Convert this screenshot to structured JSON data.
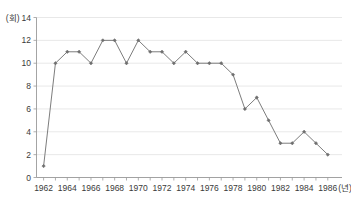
{
  "chart_data": {
    "type": "line",
    "title": "",
    "subtitle": "",
    "xlabel": "(년)",
    "ylabel": "(회)",
    "x": [
      1962,
      1963,
      1964,
      1965,
      1966,
      1967,
      1968,
      1969,
      1970,
      1971,
      1972,
      1973,
      1974,
      1975,
      1976,
      1977,
      1978,
      1979,
      1980,
      1981,
      1982,
      1983,
      1984,
      1985,
      1986
    ],
    "values": [
      1,
      10,
      11,
      11,
      10,
      12,
      12,
      10,
      12,
      11,
      11,
      10,
      11,
      10,
      10,
      10,
      9,
      6,
      7,
      5,
      3,
      3,
      4,
      3,
      2
    ],
    "series": [
      {
        "name": "",
        "values": [
          1,
          10,
          11,
          11,
          10,
          12,
          12,
          10,
          12,
          11,
          11,
          10,
          11,
          10,
          10,
          10,
          9,
          6,
          7,
          5,
          3,
          3,
          4,
          3,
          2
        ]
      }
    ],
    "x_tick_labels": [
      "1962",
      "1964",
      "1966",
      "1968",
      "1970",
      "1972",
      "1974",
      "1976",
      "1978",
      "1980",
      "1982",
      "1984",
      "1986"
    ],
    "x_tick_values": [
      1962,
      1964,
      1966,
      1968,
      1970,
      1972,
      1974,
      1976,
      1978,
      1980,
      1982,
      1984,
      1986
    ],
    "y_tick_labels": [
      "0",
      "2",
      "4",
      "6",
      "8",
      "10",
      "12",
      "14"
    ],
    "y_tick_values": [
      0,
      2,
      4,
      6,
      8,
      10,
      12,
      14
    ],
    "xlim": [
      1961.4,
      1987.2
    ],
    "ylim": [
      0,
      14
    ],
    "grid": true,
    "grid_axis": "y",
    "legend": false,
    "legend_position": "none",
    "marker": "diamond",
    "colors": {
      "line": "#7d7d7d",
      "marker": "#6e6e6e",
      "grid": "#e2e2e2",
      "axis": "#9a9a9a",
      "text": "#3a3a3a",
      "background": "#ffffff"
    }
  }
}
